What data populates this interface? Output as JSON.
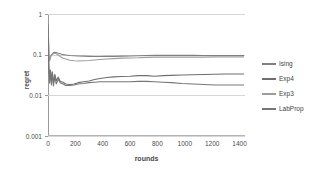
{
  "chart_data": {
    "type": "line",
    "title": "",
    "xlabel": "rounds",
    "ylabel": "regret",
    "xlim": [
      0,
      1440
    ],
    "ylim": [
      0.001,
      1
    ],
    "yscale": "log",
    "grid": true,
    "legend_position": "right",
    "xticks": [
      "0",
      "200",
      "400",
      "600",
      "800",
      "1000",
      "1200",
      "1400"
    ],
    "xtick_values": [
      0,
      200,
      400,
      600,
      800,
      1000,
      1200,
      1400
    ],
    "yticks": [
      "1",
      "0.1",
      "0.01",
      "0.001"
    ],
    "ytick_values": [
      1,
      0.1,
      0.01,
      0.001
    ],
    "series": [
      {
        "name": "Ising",
        "color": "#808080",
        "final_value": 0.095,
        "x": [
          2,
          6,
          12,
          18,
          25,
          32,
          40,
          50,
          60,
          75,
          90,
          110,
          130,
          160,
          190,
          220,
          260,
          300,
          340,
          380,
          430,
          480,
          540,
          600,
          660,
          720,
          780,
          840,
          900,
          980,
          1060,
          1140,
          1220,
          1300,
          1380,
          1430
        ],
        "values": [
          0.55,
          0.085,
          0.075,
          0.09,
          0.1,
          0.105,
          0.112,
          0.115,
          0.113,
          0.108,
          0.105,
          0.1,
          0.098,
          0.095,
          0.094,
          0.093,
          0.092,
          0.091,
          0.09,
          0.09,
          0.091,
          0.091,
          0.092,
          0.093,
          0.094,
          0.095,
          0.096,
          0.096,
          0.096,
          0.096,
          0.096,
          0.095,
          0.095,
          0.095,
          0.095,
          0.095
        ]
      },
      {
        "name": "Exp4",
        "color": "#6e6e6e",
        "final_value": 0.0335,
        "x": [
          2,
          6,
          12,
          18,
          25,
          32,
          40,
          50,
          60,
          75,
          90,
          110,
          130,
          160,
          190,
          220,
          260,
          300,
          340,
          380,
          430,
          480,
          540,
          600,
          660,
          720,
          780,
          840,
          900,
          980,
          1060,
          1140,
          1220,
          1300,
          1380,
          1430
        ],
        "values": [
          0.5,
          0.05,
          0.028,
          0.042,
          0.022,
          0.038,
          0.02,
          0.033,
          0.023,
          0.028,
          0.022,
          0.021,
          0.019,
          0.0185,
          0.019,
          0.0205,
          0.0215,
          0.0225,
          0.0245,
          0.026,
          0.0275,
          0.0285,
          0.029,
          0.0295,
          0.0305,
          0.0305,
          0.0295,
          0.0305,
          0.031,
          0.0315,
          0.032,
          0.0325,
          0.033,
          0.0335,
          0.0335,
          0.0335
        ]
      },
      {
        "name": "Exp3",
        "color": "#9d9d9d",
        "final_value": 0.088,
        "x": [
          2,
          6,
          12,
          18,
          25,
          32,
          40,
          50,
          60,
          75,
          90,
          110,
          130,
          160,
          190,
          220,
          260,
          300,
          340,
          380,
          430,
          480,
          540,
          600,
          660,
          720,
          780,
          840,
          900,
          980,
          1060,
          1140,
          1220,
          1300,
          1380,
          1430
        ],
        "values": [
          0.5,
          0.08,
          0.07,
          0.085,
          0.095,
          0.1,
          0.105,
          0.108,
          0.105,
          0.098,
          0.09,
          0.082,
          0.078,
          0.073,
          0.071,
          0.07,
          0.071,
          0.072,
          0.074,
          0.076,
          0.078,
          0.08,
          0.082,
          0.083,
          0.084,
          0.086,
          0.087,
          0.087,
          0.087,
          0.087,
          0.087,
          0.087,
          0.088,
          0.088,
          0.088,
          0.088
        ]
      },
      {
        "name": "LabProp",
        "color": "#767676",
        "final_value": 0.018,
        "x": [
          2,
          6,
          12,
          18,
          25,
          32,
          40,
          50,
          60,
          75,
          90,
          110,
          130,
          160,
          190,
          220,
          260,
          300,
          340,
          380,
          430,
          480,
          540,
          600,
          660,
          720,
          780,
          840,
          900,
          980,
          1060,
          1140,
          1220,
          1300,
          1380,
          1430
        ],
        "values": [
          0.48,
          0.045,
          0.02,
          0.04,
          0.018,
          0.035,
          0.017,
          0.03,
          0.019,
          0.025,
          0.02,
          0.019,
          0.0175,
          0.0175,
          0.018,
          0.019,
          0.0195,
          0.0205,
          0.021,
          0.0215,
          0.0215,
          0.0215,
          0.0215,
          0.0215,
          0.022,
          0.022,
          0.0215,
          0.021,
          0.0205,
          0.0195,
          0.019,
          0.0185,
          0.018,
          0.018,
          0.018,
          0.018
        ]
      }
    ]
  }
}
